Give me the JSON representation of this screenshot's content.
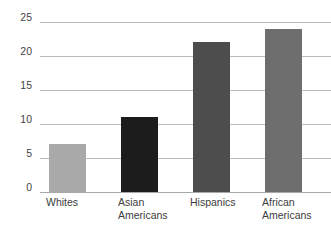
{
  "chart_data": {
    "type": "bar",
    "title": "",
    "subtitle": "",
    "xlabel": "",
    "ylabel": "",
    "categories": [
      "Whites",
      "Asian\nAmericans",
      "Hispanics",
      "African\nAmericans"
    ],
    "values": [
      7,
      11,
      22,
      24
    ],
    "ylim": [
      0,
      25
    ],
    "yticks": [
      0,
      5,
      10,
      15,
      20,
      25
    ],
    "ytick_labels": [
      "0",
      "5",
      "10",
      "15",
      "20",
      "25"
    ],
    "grid": true,
    "legend": false,
    "legend_position": "none",
    "bar_colors": [
      "#a9a9a9",
      "#1c1c1c",
      "#4d4d4d",
      "#6e6e6e"
    ],
    "gridline_color": "#bcbcbc",
    "axis_color": "#a8a8a8",
    "background_color": "#ffffff",
    "text_color": "#3d3d3d",
    "bars": [
      {
        "category": "Whites",
        "label": "Whites",
        "value": 7,
        "color": "#a9a9a9"
      },
      {
        "category": "Asian Americans",
        "label": "Asian\nAmericans",
        "value": 11,
        "color": "#1c1c1c"
      },
      {
        "category": "Hispanics",
        "label": "Hispanics",
        "value": 22,
        "color": "#4d4d4d"
      },
      {
        "category": "African Americans",
        "label": "African\nAmericans",
        "value": 24,
        "color": "#6e6e6e"
      }
    ]
  }
}
